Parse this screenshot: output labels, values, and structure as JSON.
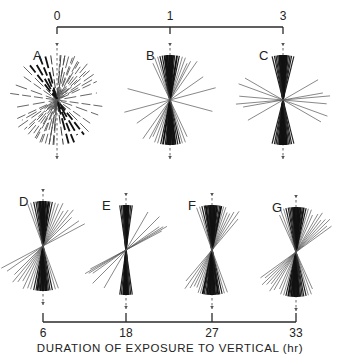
{
  "figure": {
    "top_axis": {
      "ticks": [
        {
          "label": "0",
          "x": 57
        },
        {
          "label": "1",
          "x": 170
        },
        {
          "label": "3",
          "x": 283
        }
      ],
      "line_y": 27
    },
    "bottom_axis": {
      "ticks": [
        {
          "label": "6",
          "x": 43
        },
        {
          "label": "18",
          "x": 126
        },
        {
          "label": "27",
          "x": 212
        },
        {
          "label": "33",
          "x": 296
        }
      ],
      "line_y": 322,
      "title": "DURATION OF EXPOSURE TO VERTICAL (hr)"
    },
    "panels": [
      {
        "id": "A",
        "label": "A",
        "cx": 57,
        "cy": 100,
        "r": 45,
        "style": "dashed",
        "angles": [
          -60,
          -48,
          -40,
          -35,
          -28,
          -22,
          -15,
          -10,
          -5,
          8,
          15,
          22,
          30,
          38,
          45,
          55,
          70,
          82,
          100,
          115,
          125,
          135,
          150,
          160,
          170,
          176
        ],
        "strong": [
          30,
          38,
          22,
          15
        ]
      },
      {
        "id": "B",
        "label": "B",
        "cx": 170,
        "cy": 100,
        "r": 45,
        "style": "solid",
        "angles": [
          -25,
          -20,
          -16,
          -12,
          -9,
          -6,
          -4,
          -2,
          0,
          1,
          3,
          5,
          7,
          10,
          13,
          16,
          20,
          -35,
          -55,
          75,
          -75,
          25,
          -28
        ],
        "strong": [
          -4,
          -2,
          0,
          1,
          3,
          5,
          7,
          -9
        ]
      },
      {
        "id": "C",
        "label": "C",
        "cx": 283,
        "cy": 100,
        "r": 45,
        "style": "solid",
        "angles": [
          -14,
          -11,
          -9,
          -7,
          -5,
          -3,
          -2,
          -1,
          0,
          1,
          2,
          3,
          5,
          7,
          9,
          11,
          14,
          -85,
          -80,
          60,
          70,
          -60,
          -95
        ],
        "strong": [
          -5,
          -3,
          -2,
          -1,
          0,
          1,
          2,
          3,
          5
        ]
      },
      {
        "id": "D",
        "label": "D",
        "cx": 43,
        "cy": 246,
        "r": 45,
        "style": "solid",
        "angles": [
          -20,
          -16,
          -12,
          -9,
          -7,
          -5,
          -3,
          -1,
          0,
          1,
          3,
          5,
          7,
          9,
          12,
          16,
          20,
          -25,
          -30,
          -35,
          -40,
          -45,
          -55,
          -62
        ],
        "strong": [
          -3,
          -1,
          0,
          1,
          3,
          -7,
          5
        ]
      },
      {
        "id": "E",
        "label": "E",
        "cx": 126,
        "cy": 250,
        "r": 45,
        "style": "solid",
        "angles": [
          -8,
          -6,
          -4,
          -3,
          -2,
          -1,
          0,
          1,
          2,
          3,
          4,
          6,
          8,
          -30,
          -45,
          -55,
          -58,
          -60,
          -62
        ],
        "strong": [
          -3,
          -2,
          -1,
          0,
          1,
          2,
          3
        ]
      },
      {
        "id": "F",
        "label": "F",
        "cx": 212,
        "cy": 250,
        "r": 45,
        "style": "solid",
        "angles": [
          -22,
          -18,
          -15,
          -12,
          -10,
          -8,
          -6,
          -4,
          -2,
          0,
          2,
          4,
          6,
          8,
          10,
          13,
          16,
          20,
          -26,
          -30,
          -35,
          -40
        ],
        "strong": [
          -6,
          -4,
          -2,
          0,
          2,
          4,
          8,
          -12
        ]
      },
      {
        "id": "G",
        "label": "G",
        "cx": 296,
        "cy": 252,
        "r": 45,
        "style": "solid",
        "angles": [
          -24,
          -20,
          -16,
          -13,
          -10,
          -8,
          -6,
          -4,
          -2,
          0,
          2,
          4,
          6,
          8,
          10,
          13,
          16,
          20,
          24,
          -30,
          -34,
          -38,
          -42,
          -46,
          -50,
          -54
        ],
        "strong": [
          -6,
          -4,
          -2,
          0,
          2,
          4,
          -10
        ]
      }
    ]
  }
}
